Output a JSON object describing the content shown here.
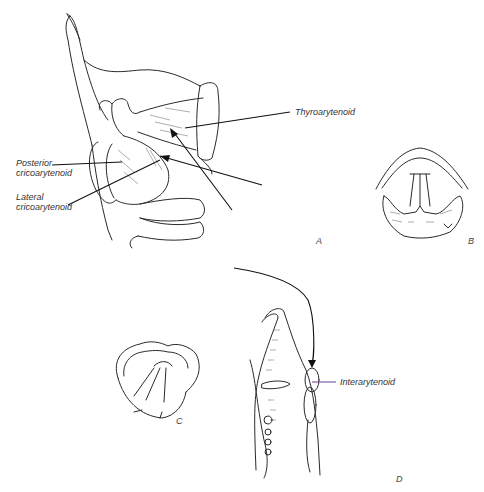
{
  "figure": {
    "panels": [
      {
        "id": "A",
        "label": "A",
        "description": "Lateral view of larynx with arrows to intrinsic muscles"
      },
      {
        "id": "B",
        "label": "B",
        "description": "Superior view of glottis, vocal folds adducted"
      },
      {
        "id": "C",
        "label": "C",
        "description": "Superior view of glottis, vocal folds abducted"
      },
      {
        "id": "D",
        "label": "D",
        "description": "Sagittal view with curved arrow to interarytenoid"
      }
    ],
    "labels": {
      "thyroarytenoid": "Thyroarytenoid",
      "posterior_cricoarytenoid_line1": "Posterior",
      "posterior_cricoarytenoid_line2": "cricoarytenoid",
      "lateral_cricoarytenoid_line1": "Lateral",
      "lateral_cricoarytenoid_line2": "cricoarytenoid",
      "interarytenoid": "Interarytenoid"
    },
    "colors": {
      "line": "#2a2a2a",
      "background": "#ffffff",
      "interarytenoid_pointer": "#6a3d8f"
    }
  }
}
